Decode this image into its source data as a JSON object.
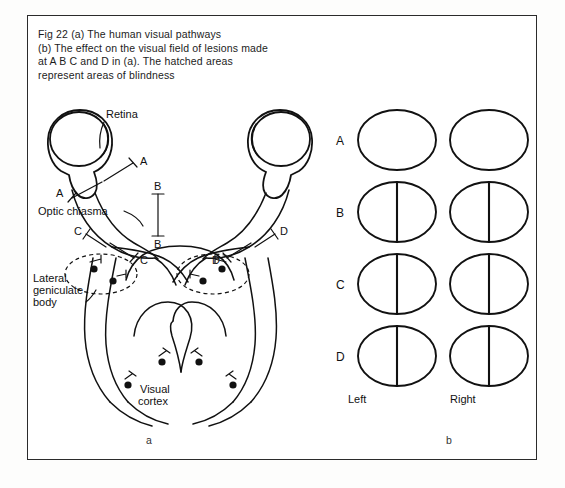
{
  "figure": {
    "caption_lines": [
      "Fig 22  (a) The human visual pathways",
      "(b) The effect on the visual field of lesions made",
      "at A  B  C  and  D  in (a).  The  hatched  areas",
      "represent areas of blindness"
    ],
    "panel_labels": {
      "left": "a",
      "right": "b"
    }
  },
  "diagram_a": {
    "labels": {
      "retina": "Retina",
      "optic_chiasma": "Optic chiasma",
      "lateral_geniculate_body_line1": "Lateral",
      "lateral_geniculate_body_line2": "geniculate",
      "lateral_geniculate_body_line3": "body",
      "visual_cortex_line1": "Visual",
      "visual_cortex_line2": "cortex"
    },
    "lesion_markers": [
      {
        "id": "A-left-upper",
        "label": "A"
      },
      {
        "id": "A-left-lower",
        "label": "A"
      },
      {
        "id": "B-upper",
        "label": "B"
      },
      {
        "id": "B-lower",
        "label": "B"
      },
      {
        "id": "C-left-upper",
        "label": "C"
      },
      {
        "id": "C-left-lower",
        "label": "C"
      },
      {
        "id": "D-right-upper",
        "label": "D"
      },
      {
        "id": "D-right-lower",
        "label": "D"
      }
    ]
  },
  "diagram_b": {
    "column_headers": {
      "left": "Left",
      "right": "Right"
    },
    "rows": [
      {
        "label": "A",
        "left_field": "full",
        "right_field": "none"
      },
      {
        "label": "B",
        "left_field": "right-half",
        "right_field": "left-half"
      },
      {
        "label": "C",
        "left_field": "left-half",
        "right_field": "left-half"
      },
      {
        "label": "D",
        "left_field": "right-half",
        "right_field": "right-half"
      }
    ],
    "legend_note": "hatched = area of blindness"
  },
  "colors": {
    "ink": "#111111",
    "frame": "#2b2b2b",
    "paper": "#ffffff",
    "page": "#fdfdfc",
    "hatch": "#3a3a3a"
  }
}
